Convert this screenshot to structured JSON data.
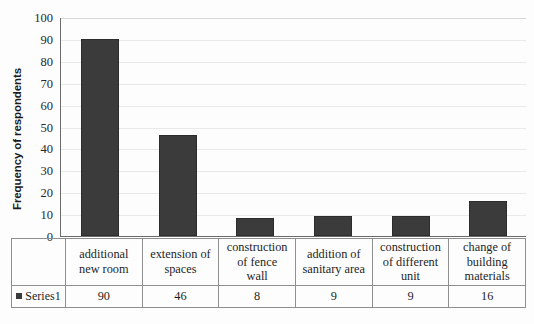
{
  "chart_data": {
    "type": "bar",
    "title": "",
    "xlabel": "",
    "ylabel": "Frequency of respondents",
    "ylim": [
      0,
      100
    ],
    "ytick_step": 10,
    "yticks": [
      100,
      90,
      80,
      70,
      60,
      50,
      40,
      30,
      20,
      10,
      0
    ],
    "grid": true,
    "legend_position": "table-left",
    "categories": [
      "additional new room",
      "extension of spaces",
      "construction of fence wall",
      "addition of sanitary area",
      "construction of different unit",
      "change of building materials"
    ],
    "category_lines": [
      [
        "additional",
        "new room"
      ],
      [
        "extension of",
        "spaces"
      ],
      [
        "construction",
        "of fence",
        "wall"
      ],
      [
        "addition of",
        "sanitary area"
      ],
      [
        "construction",
        "of different",
        "unit"
      ],
      [
        "change of",
        "building",
        "materials"
      ]
    ],
    "series": [
      {
        "name": "Series1",
        "values": [
          90,
          46,
          8,
          9,
          9,
          16
        ],
        "color": "#3b3b3b"
      }
    ]
  },
  "table": {
    "legend_label": "Series1",
    "legend_marker": "series-marker-square",
    "value_row": [
      "90",
      "46",
      "8",
      "9",
      "9",
      "16"
    ]
  },
  "colors": {
    "bar": "#3b3b3b",
    "axis": "#6b6b6b",
    "grid": "#e9e9e9",
    "table_border": "#8f8f8f",
    "text": "#1f1f1f",
    "background": "#fdfdfd"
  }
}
